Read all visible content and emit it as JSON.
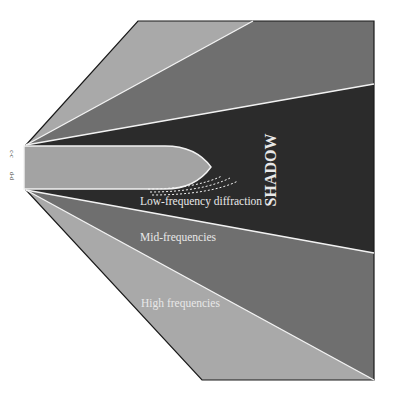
{
  "diagram": {
    "labels": {
      "shadow": "SHADOW",
      "low_frequency": "Low-frequency diffraction",
      "mid_frequency": "Mid-frequencies",
      "high_frequency": "High frequencies",
      "section_top": "c-c",
      "section_bottom": "d-d"
    },
    "colors": {
      "high_frequency_zone": "#a9a9a9",
      "mid_frequency_zone": "#6f6f6f",
      "shadow_zone": "#2b2b2b",
      "obstacle": "#a3a3a3",
      "ray_line": "#f2f2f2",
      "outline": "#1a1a1a"
    }
  }
}
